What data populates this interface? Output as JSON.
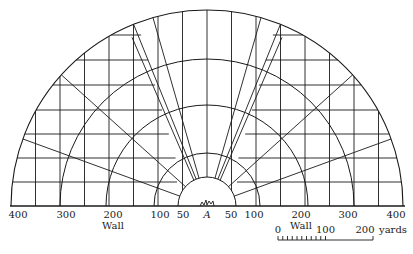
{
  "diagram": {
    "type": "semicircular fortification/amphitheatre plan with concentric arcs and radiating grid",
    "center_label": "A",
    "center_x": 207,
    "base_y": 206,
    "arcs_px_radius": [
      29,
      53,
      101,
      147,
      196
    ],
    "axis_labels_left": [
      "400",
      "300",
      "200",
      "100",
      "50"
    ],
    "axis_labels_right": [
      "50",
      "100",
      "200",
      "300",
      "400"
    ],
    "wall_label_left": "Wall",
    "wall_label_right": "Wall",
    "scale_bar": {
      "labels": [
        "0",
        "100",
        "200"
      ],
      "unit": "yards",
      "ticks": 20
    }
  }
}
